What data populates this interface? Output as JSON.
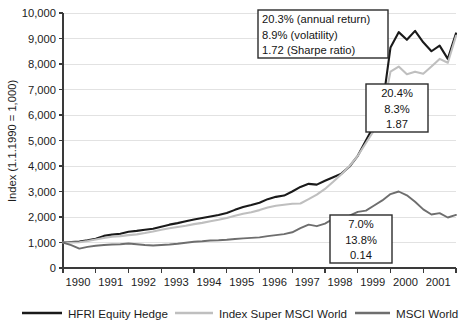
{
  "chart_data": {
    "type": "line",
    "title": "",
    "xlabel": "",
    "ylabel": "Index (1.1.1990 = 1,000)",
    "ylim": [
      0,
      10000
    ],
    "xlim": [
      1990,
      2002
    ],
    "grid": true,
    "legend_position": "bottom",
    "y_ticks": [
      "0",
      "1,000",
      "2,000",
      "3,000",
      "4,000",
      "5,000",
      "6,000",
      "7,000",
      "8,000",
      "9,000",
      "10,000"
    ],
    "y_tick_values": [
      0,
      1000,
      2000,
      3000,
      4000,
      5000,
      6000,
      7000,
      8000,
      9000,
      10000
    ],
    "x_ticks": [
      "1990",
      "1991",
      "1992",
      "1993",
      "1994",
      "1995",
      "1996",
      "1997",
      "1998",
      "1999",
      "2000",
      "2001"
    ],
    "x_tick_values": [
      1990,
      1991,
      1992,
      1993,
      1994,
      1995,
      1996,
      1997,
      1998,
      1999,
      2000,
      2001
    ],
    "series": [
      {
        "name": "HFRI Equity Hedge",
        "color": "#1a1a1a",
        "width": 2.1,
        "x": [
          1990.0,
          1990.25,
          1990.5,
          1990.75,
          1991.0,
          1991.25,
          1991.5,
          1991.75,
          1992.0,
          1992.25,
          1992.5,
          1992.75,
          1993.0,
          1993.25,
          1993.5,
          1993.75,
          1994.0,
          1994.25,
          1994.5,
          1994.75,
          1995.0,
          1995.25,
          1995.5,
          1995.75,
          1996.0,
          1996.25,
          1996.5,
          1996.75,
          1997.0,
          1997.25,
          1997.5,
          1997.75,
          1998.0,
          1998.25,
          1998.5,
          1998.75,
          1999.0,
          1999.25,
          1999.5,
          1999.75,
          2000.0,
          2000.25,
          2000.5,
          2000.75,
          2001.0,
          2001.25,
          2001.5,
          2001.75,
          2002.0
        ],
        "y": [
          1000,
          1020,
          1040,
          1090,
          1150,
          1260,
          1310,
          1345,
          1420,
          1455,
          1500,
          1540,
          1620,
          1700,
          1760,
          1830,
          1900,
          1960,
          2020,
          2080,
          2160,
          2280,
          2390,
          2470,
          2560,
          2700,
          2790,
          2840,
          3000,
          3180,
          3300,
          3270,
          3420,
          3560,
          3700,
          3980,
          4400,
          5000,
          5600,
          6300,
          8650,
          9250,
          8950,
          9300,
          8850,
          8500,
          8720,
          8200,
          9200
        ]
      },
      {
        "name": "Index Super MSCI World",
        "color": "#bfbfbf",
        "width": 2.1,
        "x": [
          1990.0,
          1990.25,
          1990.5,
          1990.75,
          1991.0,
          1991.25,
          1991.5,
          1991.75,
          1992.0,
          1992.25,
          1992.5,
          1992.75,
          1993.0,
          1993.25,
          1993.5,
          1993.75,
          1994.0,
          1994.25,
          1994.5,
          1994.75,
          1995.0,
          1995.25,
          1995.5,
          1995.75,
          1996.0,
          1996.25,
          1996.5,
          1996.75,
          1997.0,
          1997.25,
          1997.5,
          1997.75,
          1998.0,
          1998.25,
          1998.5,
          1998.75,
          1999.0,
          1999.25,
          1999.5,
          1999.75,
          2000.0,
          2000.25,
          2000.5,
          2000.75,
          2001.0,
          2001.25,
          2001.5,
          2001.75,
          2002.0
        ],
        "y": [
          1000,
          1000,
          1010,
          1060,
          1120,
          1180,
          1230,
          1250,
          1290,
          1320,
          1370,
          1430,
          1500,
          1560,
          1610,
          1660,
          1720,
          1770,
          1830,
          1890,
          1960,
          2050,
          2130,
          2190,
          2270,
          2370,
          2440,
          2480,
          2520,
          2530,
          2700,
          2880,
          3100,
          3380,
          3680,
          4000,
          4400,
          4900,
          5400,
          6100,
          7700,
          7900,
          7600,
          7700,
          7620,
          7900,
          8200,
          8050,
          9100
        ]
      },
      {
        "name": "MSCI  World",
        "color": "#6e6e6e",
        "width": 1.9,
        "x": [
          1990.0,
          1990.25,
          1990.5,
          1990.75,
          1991.0,
          1991.25,
          1991.5,
          1991.75,
          1992.0,
          1992.25,
          1992.5,
          1992.75,
          1993.0,
          1993.25,
          1993.5,
          1993.75,
          1994.0,
          1994.25,
          1994.5,
          1994.75,
          1995.0,
          1995.25,
          1995.5,
          1995.75,
          1996.0,
          1996.25,
          1996.5,
          1996.75,
          1997.0,
          1997.25,
          1997.5,
          1997.75,
          1998.0,
          1998.25,
          1998.5,
          1998.75,
          1999.0,
          1999.25,
          1999.5,
          1999.75,
          2000.0,
          2000.25,
          2000.5,
          2000.75,
          2001.0,
          2001.25,
          2001.5,
          2001.75,
          2002.0
        ],
        "y": [
          1000,
          900,
          760,
          830,
          870,
          900,
          920,
          930,
          960,
          930,
          900,
          880,
          900,
          920,
          950,
          990,
          1030,
          1050,
          1080,
          1090,
          1110,
          1140,
          1160,
          1180,
          1200,
          1250,
          1290,
          1330,
          1400,
          1560,
          1700,
          1640,
          1740,
          1930,
          1850,
          2050,
          2200,
          2250,
          2450,
          2650,
          2900,
          3000,
          2850,
          2600,
          2300,
          2100,
          2150,
          1980,
          2080
        ]
      }
    ],
    "annotations": [
      {
        "id": "callout-hfri",
        "align": "left",
        "x": 258,
        "y": 10,
        "w": 130,
        "h": 48,
        "lines": [
          "20.3% (annual return)",
          "8.9% (volatility)",
          "1.72 (Sharpe ratio)"
        ]
      },
      {
        "id": "callout-index-super",
        "align": "center",
        "x": 366,
        "y": 84,
        "w": 62,
        "h": 48,
        "lines": [
          "20.4%",
          "8.3%",
          "1.87"
        ]
      },
      {
        "id": "callout-msci-world",
        "align": "center",
        "x": 330,
        "y": 215,
        "w": 62,
        "h": 48,
        "lines": [
          "7.0%",
          "13.8%",
          "0.14"
        ]
      }
    ],
    "legend": [
      {
        "label": "HFRI Equity Hedge",
        "color": "#1a1a1a",
        "width": 2.4,
        "swatch_x": 22,
        "swatch_w": 40,
        "text_x": 68
      },
      {
        "label": "Index Super MSCI World",
        "color": "#bfbfbf",
        "width": 2.4,
        "swatch_x": 175,
        "swatch_w": 38,
        "text_x": 219
      },
      {
        "label": "MSCI  World",
        "color": "#6e6e6e",
        "width": 2.4,
        "swatch_x": 355,
        "swatch_w": 35,
        "text_x": 396
      }
    ]
  },
  "plot_geometry": {
    "left": 63,
    "right": 456,
    "top": 13,
    "bottom": 268,
    "legend_y": 313
  }
}
